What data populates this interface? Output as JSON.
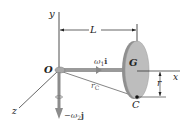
{
  "figure": {
    "type": "rigid-body-kinematics-diagram",
    "colors": {
      "background": "#ffffff",
      "line": "#222222",
      "disk_face": "#b9b9b9",
      "disk_edge": "#8a8a8a",
      "shaft": "#9a9a9a",
      "arrow": "#7a7a7a"
    }
  },
  "labels": {
    "y_axis": "y",
    "x_axis": "x",
    "z_axis": "z",
    "origin": "O",
    "length": "L",
    "center": "G",
    "point": "C",
    "radius": "r",
    "position_vector": "r",
    "position_vector_sub": "C",
    "omega1": "ω",
    "omega1_sub": "1",
    "omega1_dir": "i",
    "omega2_prefix": "−ω",
    "omega2_sub": "2",
    "omega2_dir": "j"
  }
}
